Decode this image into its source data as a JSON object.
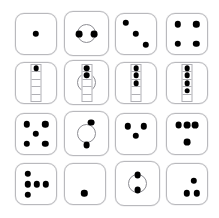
{
  "page": {
    "background_color": "#ffffff",
    "width": 219,
    "height": 218,
    "columns": 4,
    "rows": 4,
    "pip_color": "#000000",
    "tile_border_color": "#b9b9bd",
    "circle_border_color": "#8d8d93",
    "strip_border_color": "#b0b0b5"
  },
  "cells": [
    {
      "id": "cell-r1c1",
      "label": "die face one",
      "row": 1,
      "col": 1,
      "x": 15,
      "y": 13,
      "w": 42,
      "h": 42,
      "kind": "tile",
      "circle": null,
      "strip": null,
      "pip_count": 1,
      "pip_radius": 3.2,
      "pips": [
        [
          50,
          50
        ]
      ]
    },
    {
      "id": "cell-r1c2",
      "label": "die face two in circle",
      "row": 1,
      "col": 2,
      "x": 64,
      "y": 11,
      "w": 45,
      "h": 45,
      "kind": "tile-circle",
      "circle": {
        "cx": 50,
        "cy": 50,
        "r": 44
      },
      "strip": null,
      "pip_count": 2,
      "pip_radius": 3.4,
      "pips": [
        [
          33,
          52
        ],
        [
          67,
          52
        ]
      ]
    },
    {
      "id": "cell-r1c3",
      "label": "die face three",
      "row": 1,
      "col": 3,
      "x": 115,
      "y": 13,
      "w": 42,
      "h": 42,
      "kind": "tile",
      "circle": null,
      "strip": null,
      "pip_count": 3,
      "pip_radius": 3.2,
      "pips": [
        [
          26,
          24
        ],
        [
          50,
          50
        ],
        [
          74,
          76
        ]
      ]
    },
    {
      "id": "cell-r1c4",
      "label": "die face four",
      "row": 1,
      "col": 4,
      "x": 166,
      "y": 13,
      "w": 42,
      "h": 42,
      "kind": "tile",
      "circle": null,
      "strip": null,
      "pip_count": 4,
      "pip_radius": 3.2,
      "pips": [
        [
          28,
          27
        ],
        [
          72,
          27
        ],
        [
          28,
          73
        ],
        [
          72,
          73
        ]
      ]
    },
    {
      "id": "cell-r2c1",
      "label": "column strip one filled",
      "row": 2,
      "col": 1,
      "x": 15,
      "y": 62,
      "w": 42,
      "h": 42,
      "kind": "tile-strip",
      "circle": null,
      "strip": {
        "cx": 50,
        "top": 4,
        "w": 11,
        "h": 92,
        "segments": 5,
        "filled": 1
      },
      "pip_count": 1,
      "pip_radius": 3.0,
      "pips": []
    },
    {
      "id": "cell-r2c2",
      "label": "column strip two filled in circle",
      "row": 2,
      "col": 2,
      "x": 64,
      "y": 60,
      "w": 45,
      "h": 45,
      "kind": "tile-circle-strip",
      "circle": {
        "cx": 50,
        "cy": 50,
        "r": 44
      },
      "strip": {
        "cx": 50,
        "top": 8,
        "w": 11,
        "h": 86,
        "segments": 5,
        "filled": 2
      },
      "pip_count": 2,
      "pip_radius": 3.0,
      "pips": []
    },
    {
      "id": "cell-r2c3",
      "label": "column strip three filled",
      "row": 2,
      "col": 3,
      "x": 115,
      "y": 62,
      "w": 42,
      "h": 42,
      "kind": "tile-strip",
      "circle": null,
      "strip": {
        "cx": 50,
        "top": 4,
        "w": 11,
        "h": 92,
        "segments": 5,
        "filled": 3
      },
      "pip_count": 3,
      "pip_radius": 3.0,
      "pips": []
    },
    {
      "id": "cell-r2c4",
      "label": "column strip four filled",
      "row": 2,
      "col": 4,
      "x": 166,
      "y": 62,
      "w": 42,
      "h": 42,
      "kind": "tile-strip",
      "circle": null,
      "strip": {
        "cx": 50,
        "top": 4,
        "w": 11,
        "h": 92,
        "segments": 5,
        "filled": 4
      },
      "pip_count": 4,
      "pip_radius": 3.0,
      "pips": []
    },
    {
      "id": "cell-r3c1",
      "label": "die face five",
      "row": 3,
      "col": 1,
      "x": 15,
      "y": 113,
      "w": 42,
      "h": 42,
      "kind": "tile",
      "circle": null,
      "strip": null,
      "pip_count": 5,
      "pip_radius": 3.2,
      "pips": [
        [
          28,
          27
        ],
        [
          72,
          27
        ],
        [
          50,
          50
        ],
        [
          28,
          73
        ],
        [
          72,
          73
        ]
      ]
    },
    {
      "id": "cell-r3c2",
      "label": "die face two in circle diagonal",
      "row": 3,
      "col": 2,
      "x": 64,
      "y": 111,
      "w": 45,
      "h": 45,
      "kind": "tile-circle",
      "circle": {
        "cx": 50,
        "cy": 50,
        "r": 44
      },
      "strip": null,
      "pip_count": 2,
      "pip_radius": 3.4,
      "pips": [
        [
          61,
          26
        ],
        [
          50,
          76
        ]
      ]
    },
    {
      "id": "cell-r3c3",
      "label": "die face three triangle",
      "row": 3,
      "col": 3,
      "x": 115,
      "y": 113,
      "w": 42,
      "h": 42,
      "kind": "tile",
      "circle": null,
      "strip": null,
      "pip_count": 3,
      "pip_radius": 3.2,
      "pips": [
        [
          31,
          32
        ],
        [
          69,
          32
        ],
        [
          50,
          54
        ]
      ]
    },
    {
      "id": "cell-r3c4",
      "label": "die face four row and one",
      "row": 3,
      "col": 4,
      "x": 166,
      "y": 113,
      "w": 42,
      "h": 42,
      "kind": "tile",
      "circle": null,
      "strip": null,
      "pip_count": 4,
      "pip_radius": 3.4,
      "pips": [
        [
          30,
          28
        ],
        [
          50,
          28
        ],
        [
          70,
          28
        ],
        [
          50,
          70
        ]
      ]
    },
    {
      "id": "cell-r4c1",
      "label": "die face five scattered",
      "row": 4,
      "col": 1,
      "x": 15,
      "y": 163,
      "w": 42,
      "h": 42,
      "kind": "tile",
      "circle": null,
      "strip": null,
      "pip_count": 5,
      "pip_radius": 3.2,
      "pips": [
        [
          30,
          26
        ],
        [
          30,
          51
        ],
        [
          52,
          51
        ],
        [
          74,
          51
        ],
        [
          30,
          76
        ]
      ]
    },
    {
      "id": "cell-r4c2",
      "label": "die face one offset",
      "row": 4,
      "col": 2,
      "x": 64,
      "y": 163,
      "w": 42,
      "h": 42,
      "kind": "tile",
      "circle": null,
      "strip": null,
      "pip_count": 1,
      "pip_radius": 3.2,
      "pips": [
        [
          48,
          72
        ]
      ]
    },
    {
      "id": "cell-r4c3",
      "label": "die face two in circle vertical",
      "row": 4,
      "col": 3,
      "x": 115,
      "y": 161,
      "w": 45,
      "h": 45,
      "kind": "tile-circle",
      "circle": {
        "cx": 50,
        "cy": 50,
        "r": 44
      },
      "strip": null,
      "pip_count": 2,
      "pip_radius": 3.4,
      "pips": [
        [
          50,
          31
        ],
        [
          50,
          65
        ]
      ]
    },
    {
      "id": "cell-r4c4",
      "label": "die face three lower right",
      "row": 4,
      "col": 4,
      "x": 166,
      "y": 163,
      "w": 42,
      "h": 42,
      "kind": "tile",
      "circle": null,
      "strip": null,
      "pip_count": 3,
      "pip_radius": 3.2,
      "pips": [
        [
          66,
          42
        ],
        [
          50,
          72
        ],
        [
          74,
          72
        ]
      ]
    }
  ]
}
